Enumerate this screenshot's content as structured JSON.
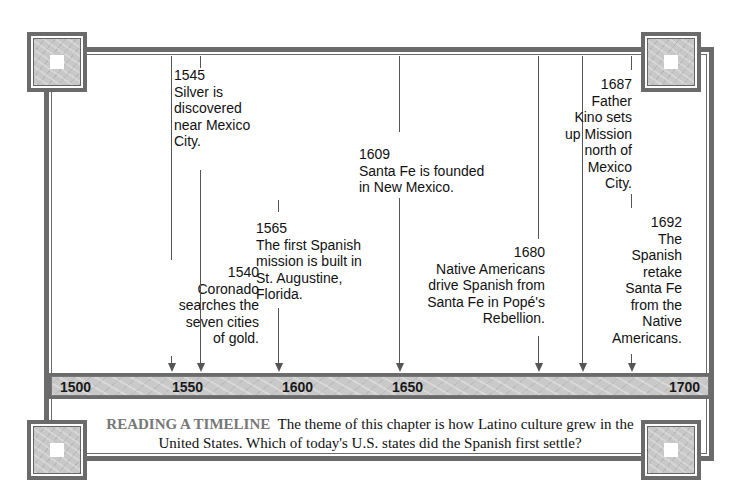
{
  "timeline": {
    "axis_ticks": [
      {
        "label": "1500",
        "x": 54
      },
      {
        "label": "1550",
        "x": 166
      },
      {
        "label": "1600",
        "x": 276
      },
      {
        "label": "1650",
        "x": 386
      },
      {
        "label": "1700",
        "x": 491
      }
    ],
    "events": [
      {
        "year": "1540",
        "text": "Coronado searches the seven cities of gold.",
        "lines": [
          "1540",
          "Coronado",
          "searches the",
          "seven cities",
          "of gold."
        ]
      },
      {
        "year": "1545",
        "text": "Silver is discovered near Mexico City.",
        "lines": [
          "1545",
          "Silver is",
          "discovered",
          "near Mexico",
          "City."
        ]
      },
      {
        "year": "1565",
        "text": "The first Spanish mission is built in St. Augustine, Florida.",
        "lines": [
          "1565",
          "The first Spanish",
          "mission is built in",
          "St. Augustine,",
          "Florida."
        ]
      },
      {
        "year": "1609",
        "text": "Santa Fe is founded in New Mexico.",
        "lines": [
          "1609",
          "Santa Fe is founded",
          "in New Mexico."
        ]
      },
      {
        "year": "1680",
        "text": "Native Americans drive Spanish from Santa Fe in Popé's Rebellion.",
        "lines": [
          "1680",
          "Native Americans",
          "drive Spanish from",
          "Santa Fe in Popé's",
          "Rebellion."
        ]
      },
      {
        "year": "1687",
        "text": "Father Kino sets up Mission north of Mexico City.",
        "lines": [
          "1687",
          "Father",
          "Kino sets",
          "up Mission",
          "north of",
          "Mexico",
          "City."
        ]
      },
      {
        "year": "1692",
        "text": "The Spanish retake Santa Fe from the Native Americans.",
        "lines": [
          "1692",
          "The",
          "Spanish",
          "retake",
          "Santa Fe",
          "from the",
          "Native",
          "Americans."
        ]
      }
    ]
  },
  "caption": {
    "label": "READING A TIMELINE",
    "text": "The theme of this chapter is how Latino culture grew in the United States. Which of today's U.S. states did the Spanish first settle?"
  },
  "colors": {
    "frame": "#6b6b6b",
    "bar_fill": "#c9c9c9",
    "caption_label": "#777777",
    "text": "#111111"
  }
}
